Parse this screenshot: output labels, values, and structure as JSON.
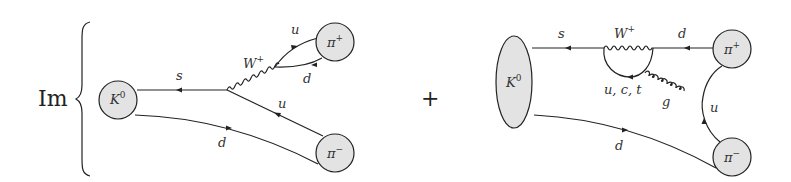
{
  "figure": {
    "type": "feynman-diagrams",
    "prefix": "Im",
    "operator": "+",
    "diagrams": [
      {
        "id": "tree-level",
        "initial": {
          "name": "K",
          "sup": "0"
        },
        "final": [
          {
            "name": "π",
            "sup": "+"
          },
          {
            "name": "π",
            "sup": "−"
          }
        ],
        "boson": {
          "name": "W",
          "sup": "+"
        },
        "quark_labels": {
          "s": "s",
          "u_top": "u",
          "d_top": "d",
          "u_mid": "u",
          "d_bottom": "d"
        }
      },
      {
        "id": "penguin",
        "initial": {
          "name": "K",
          "sup": "0"
        },
        "final": [
          {
            "name": "π",
            "sup": "+"
          },
          {
            "name": "π",
            "sup": "−"
          }
        ],
        "boson": {
          "name": "W",
          "sup": "+"
        },
        "loop_label": "u, c, t",
        "gluon_label": "g",
        "quark_labels": {
          "s": "s",
          "d_top": "d",
          "u_right": "u",
          "d_bottom": "d"
        }
      }
    ]
  }
}
